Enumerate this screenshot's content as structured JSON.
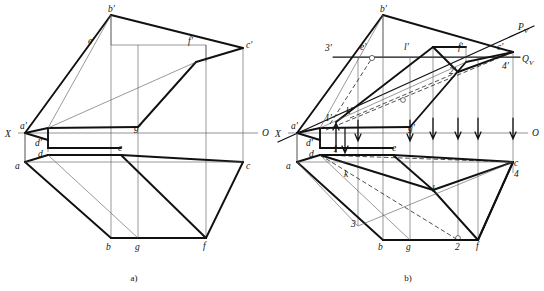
{
  "figure": {
    "title": "",
    "type": "descriptive-geometry-orthographic-projection",
    "captions": [
      {
        "id": "caption-a",
        "text": "a)",
        "x": 134,
        "y": 281
      },
      {
        "id": "caption-b",
        "text": "b)",
        "x": 408,
        "y": 281
      }
    ]
  },
  "diagram_a": {
    "id": "diagram-a",
    "axis": {
      "label_left": "X",
      "label_right": "O",
      "y": 133,
      "x1": 18,
      "x2": 258,
      "left_label_pos": {
        "x": 5,
        "y": 137
      },
      "right_label_pos": {
        "x": 262,
        "y": 136
      }
    },
    "labels": [
      {
        "name": "b-prime",
        "text": "b'",
        "x": 108,
        "y": 12
      },
      {
        "name": "e-prime",
        "text": "e'",
        "x": 88,
        "y": 44
      },
      {
        "name": "f-prime",
        "text": "f'",
        "x": 188,
        "y": 44
      },
      {
        "name": "c-prime",
        "text": "c'",
        "x": 246,
        "y": 48
      },
      {
        "name": "a-prime",
        "text": "a'",
        "x": 20,
        "y": 129
      },
      {
        "name": "g-prime",
        "text": "g'",
        "x": 134,
        "y": 131
      },
      {
        "name": "d-prime",
        "text": "d'",
        "x": 35,
        "y": 146
      },
      {
        "name": "d-point",
        "text": "d",
        "x": 38,
        "y": 157
      },
      {
        "name": "e-point",
        "text": "e",
        "x": 118,
        "y": 151
      },
      {
        "name": "a-point",
        "text": "a",
        "x": 15,
        "y": 169
      },
      {
        "name": "c-point",
        "text": "c",
        "x": 246,
        "y": 169
      },
      {
        "name": "b-point",
        "text": "b",
        "x": 106,
        "y": 250
      },
      {
        "name": "g-point",
        "text": "g",
        "x": 135,
        "y": 250
      },
      {
        "name": "f-point",
        "text": "f",
        "x": 203,
        "y": 249
      }
    ]
  },
  "diagram_b": {
    "id": "diagram-b",
    "axis": {
      "label_left": "X",
      "label_right": "O",
      "y": 133,
      "x1": 288,
      "x2": 528,
      "left_label_pos": {
        "x": 275,
        "y": 137
      },
      "right_label_pos": {
        "x": 532,
        "y": 136
      }
    },
    "trace_labels": [
      {
        "name": "trace-pv",
        "text": "P",
        "sub": "V",
        "x": 518,
        "y": 30
      },
      {
        "name": "trace-qv",
        "text": "Q",
        "sub": "V",
        "x": 522,
        "y": 62
      }
    ],
    "labels": [
      {
        "name": "b-prime",
        "text": "b'",
        "x": 380,
        "y": 12
      },
      {
        "name": "three-prime",
        "text": "3'",
        "x": 325,
        "y": 51
      },
      {
        "name": "e-prime",
        "text": "e'",
        "x": 360,
        "y": 50
      },
      {
        "name": "l-prime",
        "text": "l'",
        "x": 404,
        "y": 50
      },
      {
        "name": "f-prime",
        "text": "f'",
        "x": 458,
        "y": 50
      },
      {
        "name": "c-prime",
        "text": "c'",
        "x": 497,
        "y": 50
      },
      {
        "name": "four-prime",
        "text": "4'",
        "x": 502,
        "y": 69
      },
      {
        "name": "two-prime",
        "text": "2'",
        "x": 449,
        "y": 74
      },
      {
        "name": "k-prime",
        "text": "k'",
        "x": 346,
        "y": 114
      },
      {
        "name": "one-prime",
        "text": "1'",
        "x": 325,
        "y": 121
      },
      {
        "name": "a-prime",
        "text": "a'",
        "x": 291,
        "y": 129
      },
      {
        "name": "g-prime",
        "text": "g'",
        "x": 408,
        "y": 131
      },
      {
        "name": "d-prime",
        "text": "d'",
        "x": 306,
        "y": 146
      },
      {
        "name": "d-point",
        "text": "d",
        "x": 309,
        "y": 157
      },
      {
        "name": "one-point",
        "text": "1",
        "x": 333,
        "y": 152
      },
      {
        "name": "e-point",
        "text": "e",
        "x": 392,
        "y": 151
      },
      {
        "name": "a-point",
        "text": "a",
        "x": 286,
        "y": 169
      },
      {
        "name": "c-point",
        "text": "c",
        "x": 514,
        "y": 166
      },
      {
        "name": "four-point",
        "text": "4",
        "x": 514,
        "y": 177
      },
      {
        "name": "k-point",
        "text": "k",
        "x": 344,
        "y": 177
      },
      {
        "name": "l-point",
        "text": "l",
        "x": 432,
        "y": 192
      },
      {
        "name": "three-point",
        "text": "3",
        "x": 351,
        "y": 227
      },
      {
        "name": "b-point",
        "text": "b",
        "x": 378,
        "y": 250
      },
      {
        "name": "g-point",
        "text": "g",
        "x": 406,
        "y": 250
      },
      {
        "name": "two-point",
        "text": "2",
        "x": 455,
        "y": 250
      },
      {
        "name": "f-point",
        "text": "f",
        "x": 476,
        "y": 249
      }
    ]
  },
  "colors": {
    "ink": "#111111",
    "thin_line": "#555555",
    "axis": "#666666",
    "background": "#ffffff"
  }
}
